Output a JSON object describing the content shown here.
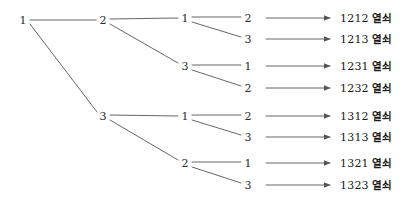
{
  "diagram": {
    "type": "probability-tree",
    "background_color": "#ffffff",
    "line_color": "#555555",
    "text_color": "#1a1a1a",
    "root": {
      "id": "root",
      "label": "1",
      "x": 23,
      "y": 20
    },
    "level2": [
      {
        "id": "l2a",
        "label": "2",
        "x": 103,
        "y": 20
      },
      {
        "id": "l2b",
        "label": "3",
        "x": 103,
        "y": 116
      }
    ],
    "level3": [
      {
        "id": "l3a",
        "label": "1",
        "x": 185,
        "y": 18,
        "parent": "l2a"
      },
      {
        "id": "l3b",
        "label": "3",
        "x": 185,
        "y": 66,
        "parent": "l2a"
      },
      {
        "id": "l3c",
        "label": "1",
        "x": 185,
        "y": 116,
        "parent": "l2b"
      },
      {
        "id": "l3d",
        "label": "2",
        "x": 185,
        "y": 163,
        "parent": "l2b"
      }
    ],
    "leaves": [
      {
        "id": "lf1",
        "label": "2",
        "x": 248,
        "y": 18,
        "parent": "l3a",
        "code": "1212",
        "word": "열쇠"
      },
      {
        "id": "lf2",
        "label": "3",
        "x": 248,
        "y": 39,
        "parent": "l3a",
        "code": "1213",
        "word": "열쇠"
      },
      {
        "id": "lf3",
        "label": "1",
        "x": 248,
        "y": 66,
        "parent": "l3b",
        "code": "1231",
        "word": "열쇠"
      },
      {
        "id": "lf4",
        "label": "2",
        "x": 248,
        "y": 88,
        "parent": "l3b",
        "code": "1232",
        "word": "열쇠"
      },
      {
        "id": "lf5",
        "label": "2",
        "x": 248,
        "y": 116,
        "parent": "l3c",
        "code": "1312",
        "word": "열쇠"
      },
      {
        "id": "lf6",
        "label": "3",
        "x": 248,
        "y": 137,
        "parent": "l3c",
        "code": "1313",
        "word": "열쇠"
      },
      {
        "id": "lf7",
        "label": "1",
        "x": 248,
        "y": 163,
        "parent": "l3d",
        "code": "1321",
        "word": "열쇠"
      },
      {
        "id": "lf8",
        "label": "3",
        "x": 248,
        "y": 185,
        "parent": "l3d",
        "code": "1323",
        "word": "열쇠"
      }
    ],
    "arrow": {
      "start_x": 266,
      "end_x": 332,
      "text_x": 340
    }
  }
}
